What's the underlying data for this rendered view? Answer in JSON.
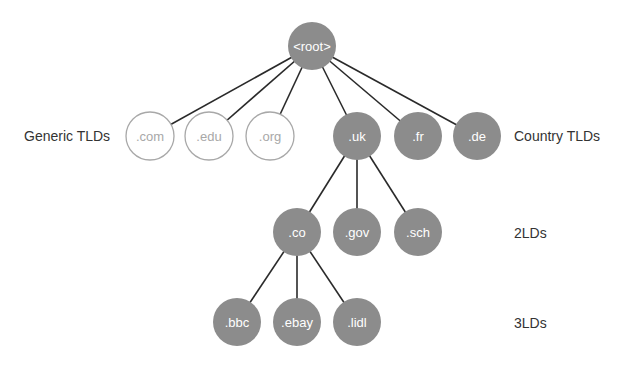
{
  "diagram": {
    "type": "tree",
    "colors": {
      "filled_node": "#8c8c8c",
      "outline_node_stroke": "#a8a8a8",
      "edge": "#2a2a2a",
      "level_label": "#333333"
    },
    "nodes": [
      {
        "id": "root",
        "label": "<root>",
        "x": 312,
        "y": 46,
        "style": "filled"
      },
      {
        "id": "com",
        "label": ".com",
        "x": 150,
        "y": 136,
        "style": "outline"
      },
      {
        "id": "edu",
        "label": ".edu",
        "x": 209,
        "y": 136,
        "style": "outline"
      },
      {
        "id": "org",
        "label": ".org",
        "x": 270,
        "y": 136,
        "style": "outline"
      },
      {
        "id": "uk",
        "label": ".uk",
        "x": 357,
        "y": 136,
        "style": "filled"
      },
      {
        "id": "fr",
        "label": ".fr",
        "x": 418,
        "y": 136,
        "style": "filled"
      },
      {
        "id": "de",
        "label": ".de",
        "x": 477,
        "y": 136,
        "style": "filled"
      },
      {
        "id": "co",
        "label": ".co",
        "x": 297,
        "y": 232,
        "style": "filled"
      },
      {
        "id": "gov",
        "label": ".gov",
        "x": 357,
        "y": 232,
        "style": "filled"
      },
      {
        "id": "sch",
        "label": ".sch",
        "x": 418,
        "y": 232,
        "style": "filled"
      },
      {
        "id": "bbc",
        "label": ".bbc",
        "x": 237,
        "y": 322,
        "style": "filled"
      },
      {
        "id": "ebay",
        "label": ".ebay",
        "x": 297,
        "y": 322,
        "style": "filled"
      },
      {
        "id": "lidl",
        "label": ".lidl",
        "x": 357,
        "y": 322,
        "style": "filled"
      }
    ],
    "edges": [
      [
        "root",
        "com"
      ],
      [
        "root",
        "edu"
      ],
      [
        "root",
        "org"
      ],
      [
        "root",
        "uk"
      ],
      [
        "root",
        "fr"
      ],
      [
        "root",
        "de"
      ],
      [
        "uk",
        "co"
      ],
      [
        "uk",
        "gov"
      ],
      [
        "uk",
        "sch"
      ],
      [
        "co",
        "bbc"
      ],
      [
        "co",
        "ebay"
      ],
      [
        "co",
        "lidl"
      ]
    ],
    "node_radius": 24,
    "level_labels": [
      {
        "id": "generic-tlds",
        "text": "Generic TLDs",
        "x": 24,
        "y": 136
      },
      {
        "id": "country-tlds",
        "text": "Country TLDs",
        "x": 514,
        "y": 136
      },
      {
        "id": "2lds",
        "text": "2LDs",
        "x": 514,
        "y": 233
      },
      {
        "id": "3lds",
        "text": "3LDs",
        "x": 514,
        "y": 323
      }
    ]
  }
}
